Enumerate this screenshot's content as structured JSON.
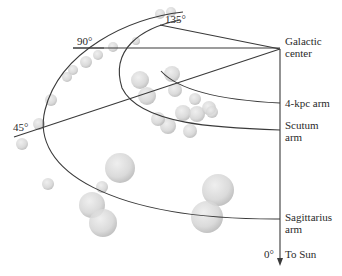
{
  "labels": {
    "galactic_center_1": "Galactic",
    "galactic_center_2": "center",
    "arm_4kpc": "4-kpc arm",
    "scutum_1": "Scutum",
    "scutum_2": "arm",
    "sagittarius_1": "Sagittarius",
    "sagittarius_2": "arm",
    "angle_0": "0°",
    "to_sun": "To Sun",
    "angle_45": "45°",
    "angle_90": "90°",
    "angle_135": "135°"
  },
  "colors": {
    "line": "#3a3a3a",
    "cloud_fill": "#d4d4d4",
    "cloud_edge": "#b8b8b8"
  },
  "clouds": [
    {
      "cx": 171,
      "cy": 12,
      "r": 5
    },
    {
      "cx": 160,
      "cy": 14,
      "r": 5
    },
    {
      "cx": 136,
      "cy": 41,
      "r": 4
    },
    {
      "cx": 113,
      "cy": 47,
      "r": 5
    },
    {
      "cx": 98,
      "cy": 55,
      "r": 5
    },
    {
      "cx": 86,
      "cy": 62,
      "r": 6
    },
    {
      "cx": 73,
      "cy": 70,
      "r": 5
    },
    {
      "cx": 67,
      "cy": 77,
      "r": 5
    },
    {
      "cx": 51,
      "cy": 100,
      "r": 6
    },
    {
      "cx": 39,
      "cy": 124,
      "r": 6
    },
    {
      "cx": 22,
      "cy": 144,
      "r": 6
    },
    {
      "cx": 48,
      "cy": 184,
      "r": 6
    },
    {
      "cx": 102,
      "cy": 187,
      "r": 6
    },
    {
      "cx": 120,
      "cy": 168,
      "r": 15
    },
    {
      "cx": 92,
      "cy": 205,
      "r": 13
    },
    {
      "cx": 103,
      "cy": 223,
      "r": 14
    },
    {
      "cx": 218,
      "cy": 190,
      "r": 16
    },
    {
      "cx": 207,
      "cy": 217,
      "r": 16
    },
    {
      "cx": 140,
      "cy": 80,
      "r": 9
    },
    {
      "cx": 147,
      "cy": 96,
      "r": 9
    },
    {
      "cx": 172,
      "cy": 74,
      "r": 8
    },
    {
      "cx": 175,
      "cy": 90,
      "r": 7
    },
    {
      "cx": 195,
      "cy": 99,
      "r": 6
    },
    {
      "cx": 183,
      "cy": 113,
      "r": 8
    },
    {
      "cx": 197,
      "cy": 114,
      "r": 8
    },
    {
      "cx": 209,
      "cy": 108,
      "r": 7
    },
    {
      "cx": 168,
      "cy": 126,
      "r": 8
    },
    {
      "cx": 190,
      "cy": 131,
      "r": 7
    },
    {
      "cx": 158,
      "cy": 119,
      "r": 7
    },
    {
      "cx": 212,
      "cy": 112,
      "r": 6
    }
  ]
}
